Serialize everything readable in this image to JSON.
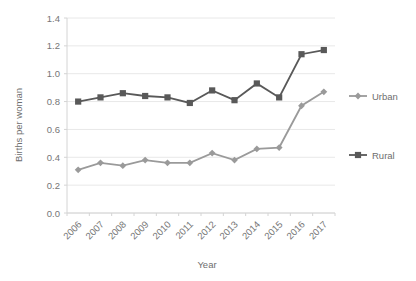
{
  "chart_data": {
    "type": "line",
    "title": "",
    "xlabel": "Year",
    "ylabel": "Births per woman",
    "categories": [
      "2006",
      "2007",
      "2008",
      "2009",
      "2010",
      "2011",
      "2012",
      "2013",
      "2014",
      "2015",
      "2016",
      "2017"
    ],
    "ylim": [
      0.0,
      1.4
    ],
    "ytick_labels": [
      "0.0",
      "0.2",
      "0.4",
      "0.6",
      "0.8",
      "1.0",
      "1.2",
      "1.4"
    ],
    "ytick_values": [
      0.0,
      0.2,
      0.4,
      0.6,
      0.8,
      1.0,
      1.2,
      1.4
    ],
    "grid": true,
    "grid_axis": "y",
    "legend_position": "right",
    "series": [
      {
        "name": "Urban",
        "color": "#9a9a9a",
        "marker": "diamond",
        "values": [
          0.31,
          0.36,
          0.34,
          0.38,
          0.36,
          0.36,
          0.43,
          0.38,
          0.46,
          0.47,
          0.77,
          0.87
        ]
      },
      {
        "name": "Rural",
        "color": "#595959",
        "marker": "square",
        "values": [
          0.8,
          0.83,
          0.86,
          0.84,
          0.83,
          0.79,
          0.88,
          0.81,
          0.93,
          0.83,
          1.14,
          1.17
        ]
      }
    ]
  },
  "axes": {
    "ylabel": "Births per woman",
    "xlabel": "Year"
  },
  "legend": {
    "items": [
      {
        "label": "Urban"
      },
      {
        "label": "Rural"
      }
    ]
  }
}
